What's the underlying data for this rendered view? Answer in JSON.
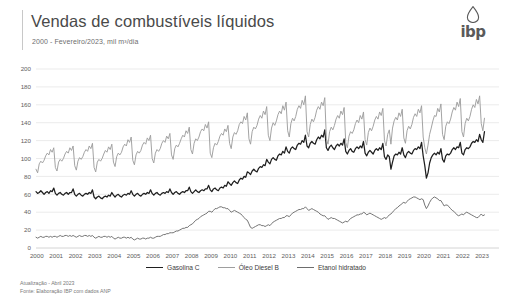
{
  "header": {
    "title": "Vendas de combustíveis líquidos",
    "subtitle": "2000 - Fevereiro/2023, mil m³/dia",
    "logo_text": "ibp",
    "logo_icon": "oil-drop-icon"
  },
  "footnote": {
    "line1": "Atualização - Abril 2023",
    "line2": "Fonte: Elaboração IBP com dados ANP"
  },
  "colors": {
    "gasolina": "#1f1f1f",
    "diesel": "#9e9e9e",
    "etanol": "#6d6d6d",
    "grid": "#e2e2e2",
    "axis": "#c9c9c9",
    "text": "#5e5e5e"
  },
  "chart_data": {
    "type": "line",
    "title": "Vendas de combustíveis líquidos",
    "subtitle": "2000 - Fevereiro/2023, mil m³/dia",
    "xlabel": "",
    "ylabel": "mil m³/dia",
    "ylim": [
      0,
      200
    ],
    "ytick_step": 20,
    "yticks": [
      0,
      20,
      40,
      60,
      80,
      100,
      120,
      140,
      160,
      180,
      200
    ],
    "xticks": [
      "2000",
      "2001",
      "2002",
      "2003",
      "2004",
      "2005",
      "2006",
      "2007",
      "2008",
      "2009",
      "2010",
      "2011",
      "2012",
      "2013",
      "2014",
      "2015",
      "2016",
      "2017",
      "2018",
      "2019",
      "2020",
      "2021",
      "2022",
      "2023"
    ],
    "xlim": [
      2000,
      2023.12
    ],
    "grid": "horizontal",
    "legend_position": "bottom-center",
    "frequency": "monthly",
    "series": [
      {
        "name": "Gasolina C",
        "color": "#1f1f1f",
        "values": [
          63,
          61,
          62,
          64,
          62,
          60,
          62,
          63,
          61,
          64,
          63,
          67,
          61,
          59,
          61,
          62,
          60,
          59,
          61,
          62,
          60,
          62,
          62,
          66,
          60,
          58,
          60,
          61,
          59,
          58,
          60,
          61,
          60,
          62,
          61,
          65,
          57,
          55,
          57,
          58,
          56,
          55,
          57,
          58,
          57,
          59,
          58,
          62,
          59,
          57,
          59,
          60,
          58,
          57,
          59,
          60,
          59,
          61,
          60,
          64,
          60,
          58,
          60,
          61,
          59,
          58,
          60,
          61,
          60,
          62,
          61,
          65,
          61,
          59,
          61,
          62,
          60,
          59,
          61,
          62,
          61,
          63,
          62,
          66,
          62,
          60,
          62,
          63,
          61,
          60,
          62,
          63,
          62,
          64,
          64,
          68,
          63,
          61,
          63,
          65,
          63,
          62,
          64,
          65,
          64,
          66,
          66,
          70,
          65,
          63,
          66,
          67,
          65,
          64,
          67,
          68,
          67,
          70,
          69,
          74,
          72,
          70,
          73,
          75,
          73,
          72,
          76,
          78,
          77,
          80,
          79,
          85,
          84,
          82,
          86,
          88,
          86,
          85,
          89,
          91,
          90,
          93,
          92,
          99,
          96,
          94,
          99,
          101,
          99,
          98,
          103,
          105,
          104,
          108,
          106,
          113,
          108,
          106,
          111,
          113,
          111,
          110,
          115,
          117,
          116,
          120,
          118,
          126,
          114,
          112,
          117,
          119,
          117,
          116,
          121,
          124,
          122,
          126,
          124,
          132,
          112,
          109,
          113,
          115,
          112,
          110,
          114,
          116,
          114,
          117,
          115,
          122,
          108,
          105,
          109,
          111,
          108,
          107,
          111,
          113,
          111,
          114,
          112,
          119,
          106,
          103,
          107,
          109,
          107,
          105,
          109,
          111,
          109,
          112,
          110,
          117,
          102,
          99,
          104,
          102,
          88,
          96,
          103,
          105,
          104,
          107,
          105,
          112,
          104,
          101,
          106,
          108,
          106,
          105,
          109,
          111,
          110,
          113,
          111,
          118,
          103,
          92,
          78,
          84,
          95,
          101,
          104,
          106,
          104,
          107,
          105,
          111,
          99,
          96,
          103,
          105,
          104,
          106,
          110,
          112,
          110,
          113,
          112,
          118,
          106,
          104,
          110,
          112,
          111,
          113,
          117,
          119,
          118,
          121,
          119,
          127,
          121,
          118,
          130
        ]
      },
      {
        "name": "Óleo Diesel B",
        "color": "#9e9e9e",
        "values": [
          88,
          84,
          94,
          97,
          95,
          98,
          103,
          106,
          104,
          110,
          107,
          112,
          90,
          86,
          96,
          99,
          97,
          100,
          105,
          108,
          106,
          112,
          109,
          114,
          92,
          87,
          97,
          101,
          99,
          102,
          107,
          110,
          108,
          114,
          111,
          117,
          90,
          85,
          96,
          99,
          97,
          100,
          105,
          109,
          107,
          113,
          110,
          116,
          96,
          91,
          102,
          106,
          104,
          107,
          113,
          116,
          114,
          121,
          118,
          124,
          98,
          93,
          104,
          108,
          106,
          109,
          115,
          118,
          116,
          123,
          120,
          126,
          100,
          95,
          106,
          110,
          108,
          111,
          117,
          120,
          118,
          125,
          122,
          128,
          104,
          99,
          111,
          115,
          113,
          117,
          122,
          126,
          124,
          131,
          128,
          135,
          110,
          105,
          117,
          122,
          120,
          124,
          130,
          133,
          131,
          138,
          134,
          141,
          106,
          101,
          112,
          117,
          115,
          119,
          125,
          128,
          126,
          133,
          130,
          137,
          117,
          111,
          124,
          129,
          127,
          131,
          138,
          141,
          139,
          147,
          143,
          151,
          122,
          116,
          130,
          135,
          133,
          137,
          144,
          148,
          145,
          153,
          149,
          158,
          126,
          120,
          134,
          140,
          137,
          142,
          149,
          153,
          150,
          159,
          154,
          163,
          131,
          124,
          139,
          145,
          142,
          147,
          155,
          159,
          156,
          165,
          160,
          170,
          130,
          124,
          138,
          144,
          141,
          146,
          154,
          158,
          155,
          163,
          159,
          168,
          122,
          116,
          130,
          135,
          132,
          137,
          144,
          148,
          145,
          153,
          149,
          157,
          118,
          112,
          125,
          130,
          128,
          132,
          139,
          143,
          140,
          148,
          144,
          152,
          121,
          115,
          129,
          134,
          131,
          136,
          143,
          147,
          144,
          152,
          148,
          156,
          120,
          114,
          127,
          132,
          116,
          134,
          142,
          146,
          143,
          151,
          147,
          155,
          123,
          117,
          131,
          136,
          133,
          138,
          146,
          150,
          147,
          155,
          151,
          159,
          124,
          112,
          105,
          115,
          127,
          134,
          142,
          148,
          147,
          156,
          152,
          161,
          127,
          121,
          136,
          141,
          139,
          144,
          152,
          157,
          154,
          163,
          158,
          167,
          130,
          124,
          139,
          145,
          142,
          147,
          155,
          160,
          157,
          166,
          161,
          170,
          139,
          131,
          145
        ]
      },
      {
        "name": "Etanol hidratado",
        "color": "#6d6d6d",
        "values": [
          12,
          11,
          12,
          13,
          12,
          12,
          13,
          13,
          12,
          13,
          12,
          13,
          13,
          12,
          13,
          14,
          13,
          13,
          14,
          14,
          13,
          14,
          13,
          14,
          13,
          12,
          13,
          14,
          13,
          13,
          14,
          14,
          13,
          14,
          13,
          14,
          12,
          11,
          12,
          13,
          12,
          12,
          13,
          13,
          12,
          13,
          12,
          13,
          11,
          10,
          11,
          12,
          11,
          11,
          12,
          12,
          11,
          12,
          11,
          12,
          10,
          9,
          10,
          11,
          10,
          10,
          11,
          11,
          10,
          11,
          11,
          12,
          11,
          11,
          12,
          13,
          13,
          13,
          14,
          15,
          15,
          16,
          16,
          17,
          17,
          17,
          18,
          19,
          19,
          20,
          21,
          22,
          22,
          23,
          23,
          25,
          26,
          27,
          29,
          31,
          32,
          33,
          35,
          36,
          37,
          38,
          39,
          41,
          41,
          40,
          42,
          44,
          44,
          45,
          46,
          46,
          45,
          45,
          44,
          44,
          42,
          40,
          41,
          42,
          41,
          40,
          39,
          38,
          36,
          34,
          32,
          31,
          27,
          23,
          22,
          23,
          24,
          25,
          26,
          26,
          25,
          25,
          24,
          25,
          26,
          25,
          27,
          29,
          30,
          31,
          32,
          33,
          33,
          34,
          34,
          36,
          36,
          35,
          37,
          39,
          40,
          41,
          42,
          43,
          43,
          44,
          44,
          46,
          44,
          42,
          43,
          44,
          43,
          42,
          41,
          40,
          38,
          37,
          36,
          36,
          34,
          32,
          33,
          34,
          33,
          33,
          32,
          31,
          30,
          29,
          28,
          29,
          30,
          29,
          31,
          33,
          34,
          35,
          36,
          37,
          37,
          38,
          38,
          40,
          39,
          37,
          38,
          39,
          38,
          37,
          36,
          35,
          34,
          33,
          32,
          33,
          34,
          33,
          35,
          37,
          38,
          40,
          42,
          44,
          45,
          47,
          48,
          50,
          51,
          50,
          52,
          54,
          55,
          56,
          57,
          57,
          56,
          55,
          54,
          55,
          54,
          48,
          44,
          47,
          51,
          54,
          56,
          57,
          56,
          55,
          53,
          53,
          50,
          47,
          48,
          48,
          46,
          44,
          42,
          41,
          39,
          37,
          36,
          37,
          38,
          37,
          39,
          40,
          39,
          38,
          37,
          36,
          35,
          34,
          34,
          36,
          38,
          36,
          37
        ]
      }
    ]
  }
}
